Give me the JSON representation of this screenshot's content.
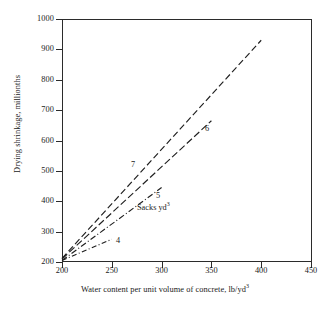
{
  "chart_data": {
    "type": "line",
    "title": "",
    "xlabel": "Water content per unit volume of concrete, lb/yd3",
    "ylabel": "Drying shrinkage, millionths",
    "xlim": [
      200,
      450
    ],
    "ylim": [
      200,
      1000
    ],
    "xticks": [
      200,
      250,
      300,
      350,
      400,
      450
    ],
    "yticks": [
      200,
      300,
      400,
      500,
      600,
      700,
      800,
      900,
      1000
    ],
    "grid": false,
    "legend": "inline-end-labels",
    "annotation": "Sacks yd3",
    "series": [
      {
        "name": "4",
        "label": "4",
        "style": "dash-dot",
        "x": [
          200,
          250
        ],
        "y": [
          205,
          275
        ]
      },
      {
        "name": "5",
        "label": "5",
        "style": "dash-dot",
        "x": [
          200,
          300
        ],
        "y": [
          205,
          445
        ]
      },
      {
        "name": "6",
        "label": "6",
        "style": "long-dash",
        "x": [
          200,
          350
        ],
        "y": [
          210,
          665
        ]
      },
      {
        "name": "7",
        "label": "7",
        "style": "dash",
        "x": [
          200,
          400
        ],
        "y": [
          212,
          930
        ]
      }
    ]
  },
  "axes": {
    "x_title_main": "Water content per unit volume of concrete, lb/yd",
    "x_title_sup": "3",
    "y_title": "Drying shrinkage, millionths",
    "xticks": [
      "200",
      "250",
      "300",
      "350",
      "400",
      "450"
    ],
    "yticks": [
      "1000",
      "900",
      "800",
      "700",
      "600",
      "500",
      "400",
      "300",
      "200"
    ]
  },
  "labels": {
    "s4": "4",
    "s5": "5",
    "s6": "6",
    "s7": "7",
    "sacks_main": "Sacks yd",
    "sacks_sup": "3"
  },
  "colors": {
    "axis": "#2b2b2b",
    "line": "#1f1f1f",
    "background": "#ffffff"
  }
}
